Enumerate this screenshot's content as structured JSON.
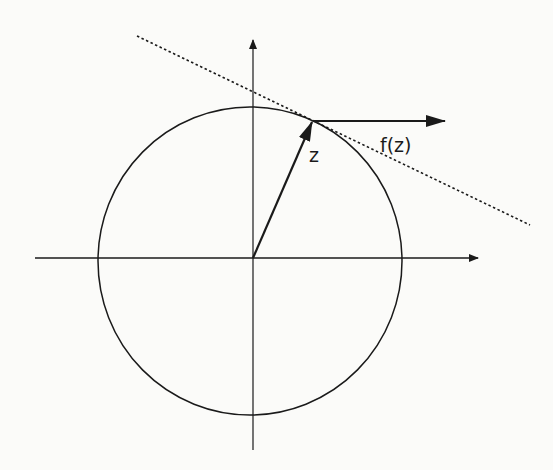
{
  "diagram": {
    "labels": {
      "z": "z",
      "fz": "f(z)"
    },
    "colors": {
      "background": "#fbfbf9",
      "ink": "#1a1a1a"
    },
    "geometry": {
      "origin": [
        253,
        258
      ],
      "radius": 155,
      "point_z": [
        313,
        121
      ],
      "fz_end": [
        445,
        121
      ]
    }
  }
}
